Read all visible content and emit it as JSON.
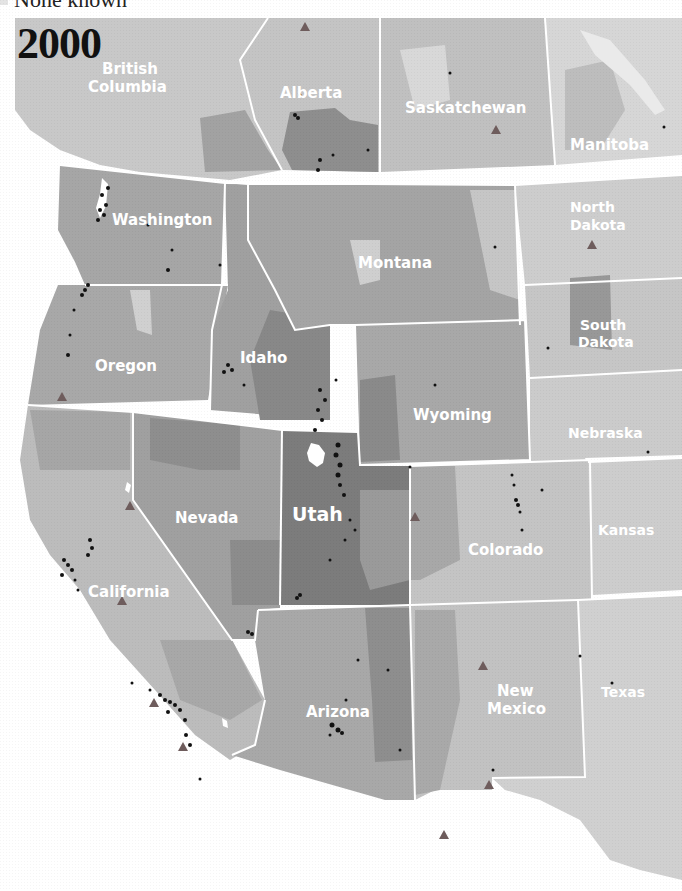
{
  "legend": {
    "partial_label": "None known",
    "swatch_color": "#e4e4e4"
  },
  "map": {
    "year": "2000",
    "colors": {
      "lightest": "#dcdcdc",
      "light": "#c8c8c8",
      "medium": "#acacac",
      "dark": "#939393",
      "darkest": "#7a7a7a",
      "border": "#ffffff",
      "dot": "#111111",
      "triangle": "#6e5c5c",
      "water": "#ffffff"
    },
    "regions": [
      {
        "name": "British Columbia",
        "label": [
          "British",
          "Columbia"
        ]
      },
      {
        "name": "Alberta",
        "label": [
          "Alberta"
        ]
      },
      {
        "name": "Saskatchewan",
        "label": [
          "Saskatchewan"
        ]
      },
      {
        "name": "Manitoba",
        "label": [
          "Manitoba"
        ]
      },
      {
        "name": "Washington",
        "label": [
          "Washington"
        ]
      },
      {
        "name": "Montana",
        "label": [
          "Montana"
        ]
      },
      {
        "name": "North Dakota",
        "label": [
          "North",
          "Dakota"
        ]
      },
      {
        "name": "Oregon",
        "label": [
          "Oregon"
        ]
      },
      {
        "name": "Idaho",
        "label": [
          "Idaho"
        ]
      },
      {
        "name": "South Dakota",
        "label": [
          "South",
          "Dakota"
        ]
      },
      {
        "name": "Wyoming",
        "label": [
          "Wyoming"
        ]
      },
      {
        "name": "Nebraska",
        "label": [
          "Nebraska"
        ]
      },
      {
        "name": "Nevada",
        "label": [
          "Nevada"
        ]
      },
      {
        "name": "Utah",
        "label": [
          "Utah"
        ]
      },
      {
        "name": "Colorado",
        "label": [
          "Colorado"
        ]
      },
      {
        "name": "Kansas",
        "label": [
          "Kansas"
        ]
      },
      {
        "name": "California",
        "label": [
          "California"
        ]
      },
      {
        "name": "Arizona",
        "label": [
          "Arizona"
        ]
      },
      {
        "name": "New Mexico",
        "label": [
          "New",
          "Mexico"
        ]
      },
      {
        "name": "Texas",
        "label": [
          "Texas"
        ]
      }
    ],
    "labels": {
      "british_columbia_1": "British",
      "british_columbia_2": "Columbia",
      "alberta": "Alberta",
      "saskatchewan": "Saskatchewan",
      "manitoba": "Manitoba",
      "washington": "Washington",
      "montana": "Montana",
      "north_dakota_1": "North",
      "north_dakota_2": "Dakota",
      "oregon": "Oregon",
      "idaho": "Idaho",
      "south_dakota_1": "South",
      "south_dakota_2": "Dakota",
      "wyoming": "Wyoming",
      "nebraska": "Nebraska",
      "nevada": "Nevada",
      "utah": "Utah",
      "colorado": "Colorado",
      "kansas": "Kansas",
      "california": "California",
      "arizona": "Arizona",
      "new_mexico_1": "New",
      "new_mexico_2": "Mexico",
      "texas": "Texas"
    },
    "triangle_markers": [
      {
        "x": 305,
        "y": 28
      },
      {
        "x": 496,
        "y": 131
      },
      {
        "x": 592,
        "y": 246
      },
      {
        "x": 62,
        "y": 398
      },
      {
        "x": 122,
        "y": 602
      },
      {
        "x": 154,
        "y": 704
      },
      {
        "x": 183,
        "y": 748
      },
      {
        "x": 483,
        "y": 667
      },
      {
        "x": 489,
        "y": 786
      },
      {
        "x": 444,
        "y": 836
      },
      {
        "x": 415,
        "y": 518
      },
      {
        "x": 130,
        "y": 507
      }
    ]
  }
}
